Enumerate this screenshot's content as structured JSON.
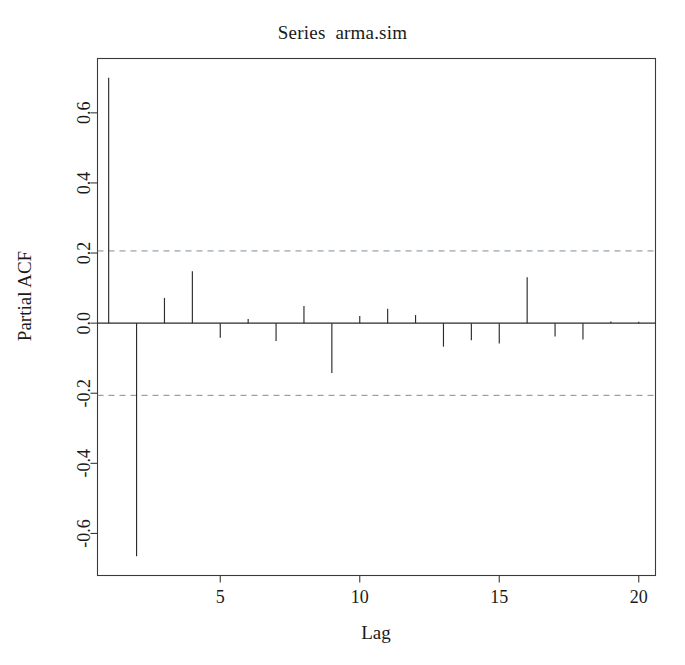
{
  "chart_data": {
    "type": "bar",
    "title": "Series  arma.sim",
    "xlabel": "Lag",
    "ylabel": "Partial ACF",
    "grid": false,
    "legend": null,
    "xlim": [
      0.6,
      20.6
    ],
    "ylim": [
      -0.72,
      0.755
    ],
    "xticks": [
      5,
      10,
      15,
      20
    ],
    "xtick_labels": [
      "5",
      "10",
      "15",
      "20"
    ],
    "yticks": [
      0.6,
      0.4,
      0.2,
      0.0,
      -0.2,
      -0.4,
      -0.6
    ],
    "ytick_labels": [
      "0.6",
      "0.4",
      "0.2",
      "0.0",
      "-0.2",
      "-0.4",
      "-0.6"
    ],
    "confidence_bounds": [
      0.206,
      -0.206
    ],
    "confidence_line_style": "dashed",
    "confidence_color": "#7d8c99",
    "bar_color": "#2b2b2b",
    "categories": [
      1,
      2,
      3,
      4,
      5,
      6,
      7,
      8,
      9,
      10,
      11,
      12,
      13,
      14,
      15,
      16,
      17,
      18,
      19,
      20
    ],
    "values": [
      0.7,
      -0.665,
      0.072,
      0.148,
      -0.042,
      0.012,
      -0.051,
      0.049,
      -0.142,
      0.02,
      0.041,
      0.023,
      -0.067,
      -0.049,
      -0.058,
      0.131,
      -0.038,
      -0.047,
      0.005,
      0.004
    ],
    "series": [
      {
        "name": "Partial ACF",
        "values": [
          0.7,
          -0.665,
          0.072,
          0.148,
          -0.042,
          0.012,
          -0.051,
          0.049,
          -0.142,
          0.02,
          0.041,
          0.023,
          -0.067,
          -0.049,
          -0.058,
          0.131,
          -0.038,
          -0.047,
          0.005,
          0.004
        ]
      }
    ]
  },
  "figure": {
    "title": "Series  arma.sim",
    "axis_x_label": "Lag",
    "axis_y_label": "Partial ACF"
  }
}
